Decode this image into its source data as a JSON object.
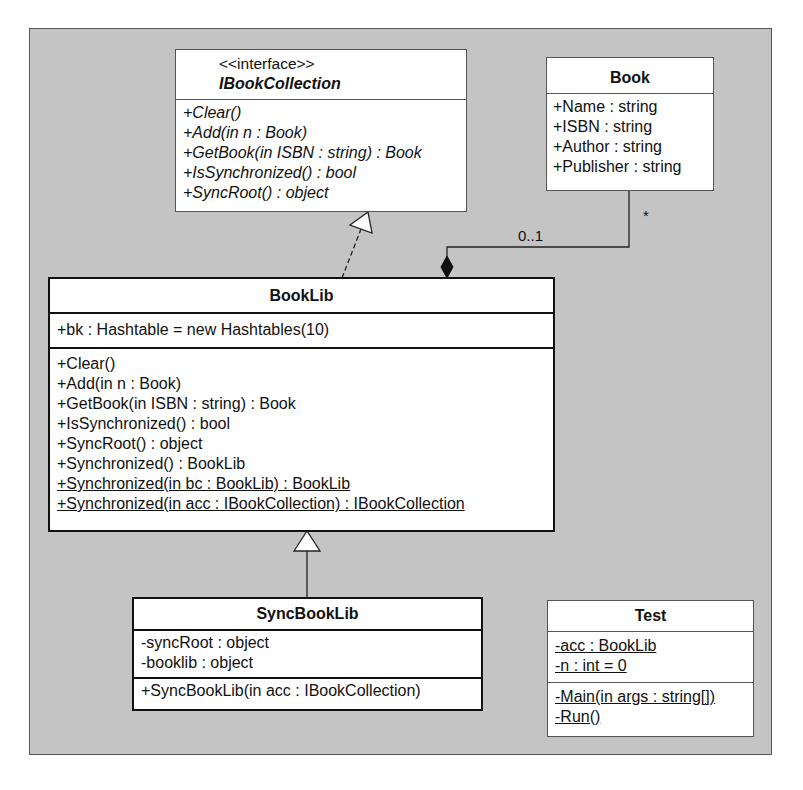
{
  "diagram": {
    "type": "UML class diagram",
    "classes": {
      "ibookcollection": {
        "stereotype": "<<interface>>",
        "name": "IBookCollection",
        "attributes": [],
        "operations": [
          "+Clear()",
          "+Add(in n : Book)",
          "+GetBook(in ISBN : string) : Book",
          "+IsSynchronized() : bool",
          "+SyncRoot() : object"
        ]
      },
      "book": {
        "name": "Book",
        "attributes": [
          "+Name : string",
          "+ISBN : string",
          "+Author : string",
          "+Publisher : string"
        ]
      },
      "booklib": {
        "name": "BookLib",
        "attributes": [
          "+bk : Hashtable = new Hashtables(10)"
        ],
        "operations": [
          "+Clear()",
          "+Add(in n : Book)",
          "+GetBook(in ISBN : string) : Book",
          "+IsSynchronized() : bool",
          "+SyncRoot() : object",
          "+Synchronized() : BookLib",
          "+Synchronized(in bc : BookLib) : BookLib",
          "+Synchronized(in acc : IBookCollection) : IBookCollection"
        ]
      },
      "syncbooklib": {
        "name": "SyncBookLib",
        "attributes": [
          "-syncRoot : object",
          "-booklib : object"
        ],
        "operations": [
          "+SyncBookLib(in acc : IBookCollection)"
        ]
      },
      "test": {
        "name": "Test",
        "attributes": [
          "-acc : BookLib",
          "-n : int = 0"
        ],
        "operations": [
          "-Main(in args : string[])",
          "-Run()"
        ]
      }
    },
    "relationships": {
      "realization": {
        "from": "BookLib",
        "to": "IBookCollection",
        "style": "dashed, hollow triangle"
      },
      "generalization": {
        "from": "SyncBookLib",
        "to": "BookLib",
        "style": "solid, hollow triangle"
      },
      "composition": {
        "whole": "BookLib",
        "part": "Book",
        "whole_multiplicity": "0..1",
        "part_multiplicity": "*"
      }
    },
    "colors": {
      "background": "#c4c4c4",
      "box_fill": "#ffffff",
      "line": "#111111"
    }
  }
}
